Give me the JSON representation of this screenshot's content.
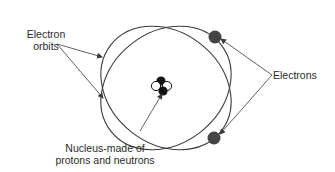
{
  "diagram": {
    "type": "atom-model",
    "labels": {
      "orbits_line1": "Electron",
      "orbits_line2": "orbits",
      "electrons": "Electrons",
      "nucleus_line1": "Nucleus-made of",
      "nucleus_line2": "protons and neutrons"
    },
    "colors": {
      "line": "#3a3a3a",
      "electron": "#444444",
      "neutron": "#111111",
      "proton_fill": "#ffffff",
      "text": "#2a2a2a"
    },
    "components": {
      "orbit_count": 2,
      "electron_count": 2,
      "nucleus_particles": 4
    }
  }
}
